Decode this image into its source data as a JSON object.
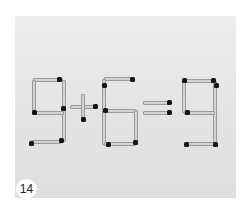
{
  "image": {
    "subject": "matchstick puzzle photograph",
    "equation": "9+6=9",
    "badge_label": "14"
  },
  "colors": {
    "page_background": "#ffffff",
    "photo_background": "#e6e6e6",
    "match_stick": "#d3d3d3",
    "match_head": "#151515"
  }
}
